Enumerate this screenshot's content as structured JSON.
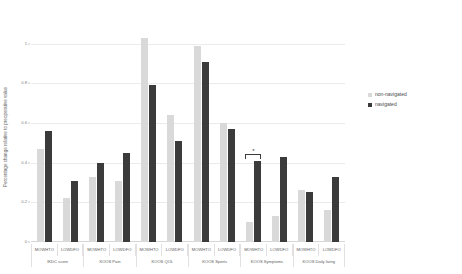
{
  "chart_data": {
    "type": "bar",
    "title": "",
    "xlabel": "",
    "ylabel": "Percentage change relative to preoperative value",
    "ylim": [
      0,
      1.08
    ],
    "yticks": [
      "0",
      "0.2",
      "0.4",
      "0.6",
      "0.8",
      "1"
    ],
    "ytick_values": [
      0,
      0.2,
      0.4,
      0.6,
      0.8,
      1
    ],
    "grid": true,
    "legend_position": "right",
    "groups": [
      {
        "label": "IKDC score",
        "subgroups": [
          {
            "label": "MOWHTO",
            "non_navigated": 0.47,
            "navigated": 0.56,
            "significant": false
          },
          {
            "label": "LOWDFO",
            "non_navigated": 0.22,
            "navigated": 0.31,
            "significant": false
          }
        ]
      },
      {
        "label": "KOOS Pain",
        "subgroups": [
          {
            "label": "MOWHTO",
            "non_navigated": 0.33,
            "navigated": 0.4,
            "significant": false
          },
          {
            "label": "LOWDFO",
            "non_navigated": 0.31,
            "navigated": 0.45,
            "significant": false
          }
        ]
      },
      {
        "label": "KOOS QOL",
        "subgroups": [
          {
            "label": "MOWHTO",
            "non_navigated": 1.03,
            "navigated": 0.79,
            "significant": false
          },
          {
            "label": "LOWDFO",
            "non_navigated": 0.64,
            "navigated": 0.51,
            "significant": false
          }
        ]
      },
      {
        "label": "KOOS Sports",
        "subgroups": [
          {
            "label": "MOWHTO",
            "non_navigated": 0.99,
            "navigated": 0.91,
            "significant": false
          },
          {
            "label": "LOWDFO",
            "non_navigated": 0.6,
            "navigated": 0.57,
            "significant": false
          }
        ]
      },
      {
        "label": "KOOS Symptoms",
        "subgroups": [
          {
            "label": "MOWHTO",
            "non_navigated": 0.1,
            "navigated": 0.41,
            "significant": true,
            "significance_marker": "*"
          },
          {
            "label": "LOWDFO",
            "non_navigated": 0.13,
            "navigated": 0.43,
            "significant": false
          }
        ]
      },
      {
        "label": "KOOS Daily living",
        "subgroups": [
          {
            "label": "MOWHTO",
            "non_navigated": 0.26,
            "navigated": 0.25,
            "significant": false
          },
          {
            "label": "LOWDFO",
            "non_navigated": 0.16,
            "navigated": 0.33,
            "significant": false
          }
        ]
      }
    ],
    "series": [
      {
        "name": "non-navigated",
        "color": "#d9d9d9",
        "values": [
          0.47,
          0.22,
          0.33,
          0.31,
          1.03,
          0.64,
          0.99,
          0.6,
          0.1,
          0.13,
          0.26,
          0.16
        ]
      },
      {
        "name": "navigated",
        "color": "#3b3b3b",
        "values": [
          0.56,
          0.31,
          0.4,
          0.45,
          0.79,
          0.51,
          0.91,
          0.57,
          0.41,
          0.43,
          0.25,
          0.33
        ]
      }
    ],
    "categories": [
      "IKDC score MOWHTO",
      "IKDC score LOWDFO",
      "KOOS Pain MOWHTO",
      "KOOS Pain LOWDFO",
      "KOOS QOL MOWHTO",
      "KOOS QOL LOWDFO",
      "KOOS Sports MOWHTO",
      "KOOS Sports LOWDFO",
      "KOOS Symptoms MOWHTO",
      "KOOS Symptoms LOWDFO",
      "KOOS Daily living MOWHTO",
      "KOOS Daily living LOWDFO"
    ]
  },
  "legend": {
    "items": [
      {
        "label": "non-navigated",
        "color": "#d9d9d9"
      },
      {
        "label": "navigated",
        "color": "#3b3b3b"
      }
    ]
  },
  "colors": {
    "non_navigated": "#d9d9d9",
    "navigated": "#3b3b3b",
    "gridline": "#eceaea",
    "text": "#5e5e5e"
  }
}
